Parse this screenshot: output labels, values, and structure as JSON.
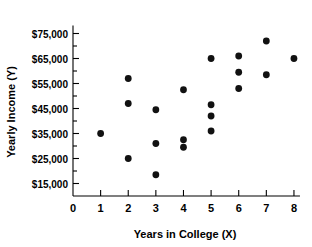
{
  "chart_data": {
    "type": "scatter",
    "title": "",
    "xlabel": "Years in College (X)",
    "ylabel": "Yearly Income (Y)",
    "xlim": [
      0,
      8.4
    ],
    "ylim": [
      10000,
      78000
    ],
    "grid": false,
    "legend": null,
    "x_ticks": [
      "0",
      "1",
      "2",
      "3",
      "4",
      "5",
      "6",
      "7",
      "8"
    ],
    "x_tick_values": [
      0,
      1,
      2,
      3,
      4,
      5,
      6,
      7,
      8
    ],
    "y_ticks": [
      "$15,000",
      "$25,000",
      "$35,000",
      "$45,000",
      "$55,000",
      "$65,000",
      "$75,000"
    ],
    "y_tick_values": [
      15000,
      25000,
      35000,
      45000,
      55000,
      65000,
      75000
    ],
    "y_minor_tick_values": [
      20000,
      30000,
      40000,
      50000,
      60000,
      70000
    ],
    "marker": "filled-circle",
    "marker_color": "#111111",
    "points": [
      {
        "x": 1,
        "y": 35000
      },
      {
        "x": 2,
        "y": 57000
      },
      {
        "x": 2,
        "y": 47000
      },
      {
        "x": 2,
        "y": 25000
      },
      {
        "x": 3,
        "y": 44500
      },
      {
        "x": 3,
        "y": 31000
      },
      {
        "x": 3,
        "y": 18500
      },
      {
        "x": 4,
        "y": 52500
      },
      {
        "x": 4,
        "y": 32500
      },
      {
        "x": 4,
        "y": 29500
      },
      {
        "x": 5,
        "y": 65000
      },
      {
        "x": 5,
        "y": 46500
      },
      {
        "x": 5,
        "y": 42000
      },
      {
        "x": 5,
        "y": 36000
      },
      {
        "x": 6,
        "y": 66000
      },
      {
        "x": 6,
        "y": 59500
      },
      {
        "x": 6,
        "y": 53000
      },
      {
        "x": 7,
        "y": 72000
      },
      {
        "x": 7,
        "y": 58500
      },
      {
        "x": 8,
        "y": 65000
      }
    ]
  }
}
